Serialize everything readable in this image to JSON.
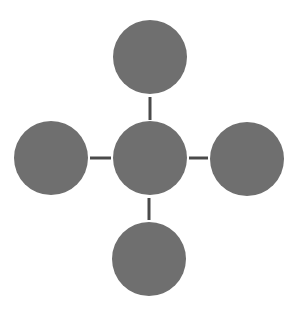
{
  "diagram": {
    "type": "hub-and-spoke",
    "background": "#ffffff",
    "node_color": "#6f6f6f",
    "connector_color": "#4a4a4a",
    "connector_width": 3,
    "node_radius": 37,
    "nodes": [
      {
        "id": "center",
        "cx": 150,
        "cy": 158,
        "label": ""
      },
      {
        "id": "top",
        "cx": 150,
        "cy": 57,
        "label": ""
      },
      {
        "id": "left",
        "cx": 51,
        "cy": 158,
        "label": ""
      },
      {
        "id": "right",
        "cx": 247,
        "cy": 159,
        "label": ""
      },
      {
        "id": "bottom",
        "cx": 149,
        "cy": 259,
        "label": ""
      }
    ],
    "edges": [
      {
        "from": "center",
        "to": "top",
        "x1": 150,
        "y1": 97,
        "x2": 150,
        "y2": 120
      },
      {
        "from": "center",
        "to": "left",
        "x1": 90,
        "y1": 158,
        "x2": 111,
        "y2": 158
      },
      {
        "from": "center",
        "to": "right",
        "x1": 189,
        "y1": 158,
        "x2": 208,
        "y2": 158
      },
      {
        "from": "center",
        "to": "bottom",
        "x1": 149,
        "y1": 198,
        "x2": 149,
        "y2": 220
      }
    ]
  }
}
